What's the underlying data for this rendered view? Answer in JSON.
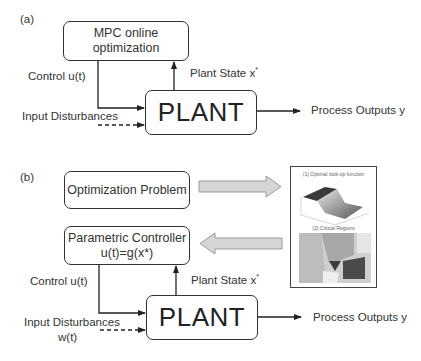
{
  "panel_a": {
    "tag": "(a)",
    "mpc_box": {
      "line1": "MPC online",
      "line2": "optimization"
    },
    "control_label": "Control u(t)",
    "plant_state_label": "Plant State x",
    "plant_state_sup": "*",
    "plant_label": "PLANT",
    "disturbance_label": "Input Disturbances",
    "output_label": "Process Outputs y"
  },
  "panel_b": {
    "tag": "(b)",
    "optimization_box": "Optimization Problem",
    "controller_box": {
      "line1": "Parametric Controller",
      "line2": "u(t)=g(x*)"
    },
    "control_label": "Control u(t)",
    "plant_state_label": "Plant State x",
    "plant_state_sup": "*",
    "plant_label": "PLANT",
    "disturbance_label": "Input Disturbances",
    "disturbance_sub": "w(t)",
    "output_label": "Process Outputs y",
    "thumbnail": {
      "caption1": "(1) Optimal look-up function",
      "caption2": "(2) Critical Regions"
    }
  },
  "colors": {
    "line": "#222222",
    "block_arrow_fill": "#d6d6d6",
    "block_arrow_stroke": "#9a9a9a"
  }
}
